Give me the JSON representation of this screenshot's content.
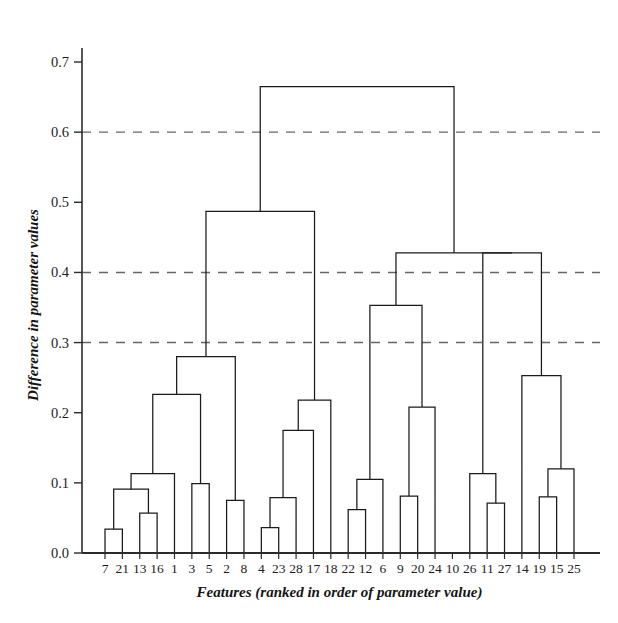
{
  "chart_data": {
    "type": "line",
    "plot_kind": "dendrogram",
    "title": "",
    "xlabel": "Features (ranked in order of parameter value)",
    "ylabel": "Difference in parameter values",
    "ylim": [
      0.0,
      0.73
    ],
    "ytick_labels": [
      "0.0",
      "0.1",
      "0.2",
      "0.3",
      "0.4",
      "0.5",
      "0.6",
      "0.7"
    ],
    "ytick_values": [
      0.0,
      0.1,
      0.2,
      0.3,
      0.4,
      0.5,
      0.6,
      0.7
    ],
    "grid": "horizontal dashed gridlines at 0.3, 0.4 and 0.6 only",
    "gridlines": [
      0.3,
      0.4,
      0.6
    ],
    "legend": "none",
    "leaf_order": [
      "7",
      "21",
      "13",
      "16",
      "1",
      "3",
      "5",
      "2",
      "8",
      "4",
      "23",
      "28",
      "17",
      "18",
      "22",
      "12",
      "6",
      "9",
      "20",
      "24",
      "10",
      "26",
      "11",
      "27",
      "14",
      "19",
      "15",
      "25"
    ],
    "categories": [
      "7",
      "21",
      "13",
      "16",
      "1",
      "3",
      "5",
      "2",
      "8",
      "4",
      "23",
      "28",
      "17",
      "18",
      "22",
      "12",
      "6",
      "9",
      "20",
      "24",
      "10",
      "26",
      "11",
      "27",
      "14",
      "19",
      "15",
      "25"
    ],
    "n_leaves": 28,
    "merges": [
      {
        "id": "m1",
        "left": "7",
        "right": "21",
        "height": 0.034
      },
      {
        "id": "m2",
        "left": "13",
        "right": "16",
        "height": 0.057
      },
      {
        "id": "m3",
        "left": "m1",
        "right": "m2",
        "height": 0.091
      },
      {
        "id": "m4",
        "left": "m3",
        "right": "1",
        "height": 0.113
      },
      {
        "id": "m5",
        "left": "3",
        "right": "5",
        "height": 0.099
      },
      {
        "id": "m6",
        "left": "m4",
        "right": "m5",
        "height": 0.226
      },
      {
        "id": "m7",
        "left": "2",
        "right": "8",
        "height": 0.075
      },
      {
        "id": "m8",
        "left": "m6",
        "right": "m7",
        "height": 0.28
      },
      {
        "id": "m9",
        "left": "4",
        "right": "23",
        "height": 0.036
      },
      {
        "id": "m10",
        "left": "m9",
        "right": "28",
        "height": 0.079
      },
      {
        "id": "m11",
        "left": "m10",
        "right": "17",
        "height": 0.175
      },
      {
        "id": "m12",
        "left": "m11",
        "right": "18",
        "height": 0.218
      },
      {
        "id": "m13",
        "left": "m8",
        "right": "m12",
        "height": 0.487
      },
      {
        "id": "m14",
        "left": "22",
        "right": "12",
        "height": 0.062
      },
      {
        "id": "m15",
        "left": "m14",
        "right": "6",
        "height": 0.105
      },
      {
        "id": "m16",
        "left": "9",
        "right": "20",
        "height": 0.081
      },
      {
        "id": "m17",
        "left": "m16",
        "right": "24",
        "height": 0.208
      },
      {
        "id": "m18",
        "left": "m15",
        "right": "m17",
        "height": 0.353
      },
      {
        "id": "m19",
        "left": "11",
        "right": "27",
        "height": 0.071
      },
      {
        "id": "m20",
        "left": "26",
        "right": "m19",
        "height": 0.113
      },
      {
        "id": "m21",
        "left": "19",
        "right": "15",
        "height": 0.08
      },
      {
        "id": "m22",
        "left": "m21",
        "right": "25",
        "height": 0.12
      },
      {
        "id": "m23",
        "left": "14",
        "right": "m22",
        "height": 0.253
      },
      {
        "id": "m24",
        "left": "m20",
        "right": "m23",
        "height": 0.428
      },
      {
        "id": "m25",
        "left": "m18",
        "right": "m24",
        "height": 0.428
      },
      {
        "id": "m26",
        "left": "m13",
        "right": "m25",
        "height": 0.665
      }
    ],
    "leaf_10_note": "leaf 10 joins cluster m18 at 0.353"
  },
  "colors": {
    "line": "#1a1a1a",
    "grid": "#666666",
    "axis": "#2b2b2b",
    "background": "#ffffff"
  }
}
